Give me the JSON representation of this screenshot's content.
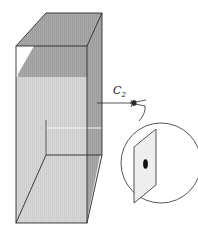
{
  "figure": {
    "observer_label": "C",
    "observer_subscript": "2",
    "colors": {
      "outline": "#2b2b2b",
      "shade_dark": "#a9a9a9",
      "shade_mid": "#bfbfbf",
      "shade_light": "#d4d4d4",
      "plate_fill": "#eeeeee",
      "spot": "#111111",
      "background": "#ffffff"
    }
  }
}
